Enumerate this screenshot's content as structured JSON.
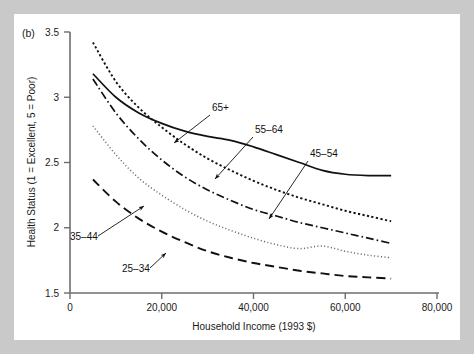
{
  "panel": {
    "label": "(b)"
  },
  "axes": {
    "x": {
      "title": "Household Income (1993 $)",
      "ticks": [
        "0",
        "20,000",
        "40,000",
        "60,000",
        "80,000"
      ],
      "tick_values": [
        0,
        20000,
        40000,
        60000,
        80000
      ],
      "range": [
        0,
        80000
      ]
    },
    "y": {
      "title": "Health Status (1 = Excellent, 5 = Poor)",
      "ticks": [
        "1.5",
        "2",
        "2.5",
        "3",
        "3.5"
      ],
      "tick_values": [
        1.5,
        2,
        2.5,
        3,
        3.5
      ],
      "range": [
        1.5,
        3.5
      ]
    }
  },
  "annotations": [
    {
      "id": "lbl-65plus",
      "text": "65+",
      "x": 198,
      "y": 97,
      "ax": 196,
      "ay": 101,
      "tx": 160,
      "ty": 129
    },
    {
      "id": "lbl-55-64",
      "text": "55–64",
      "x": 241,
      "y": 119,
      "ax": 239,
      "ay": 123,
      "tx": 201,
      "ty": 165
    },
    {
      "id": "lbl-45-54",
      "text": "45–54",
      "x": 296,
      "y": 143,
      "ax": 294,
      "ay": 147,
      "tx": 255,
      "ty": 205
    },
    {
      "id": "lbl-35-44",
      "text": "35–44",
      "x": 56,
      "y": 226,
      "ax": 84,
      "ay": 222,
      "tx": 130,
      "ty": 192
    },
    {
      "id": "lbl-25-34",
      "text": "25–34",
      "x": 108,
      "y": 258,
      "ax": 136,
      "ay": 254,
      "tx": 152,
      "ty": 239
    }
  ],
  "chart_data": {
    "type": "line",
    "title": "",
    "xlabel": "Household Income (1993 $)",
    "ylabel": "Health Status (1 = Excellent, 5 = Poor)",
    "xlim": [
      0,
      80000
    ],
    "ylim": [
      1.5,
      3.5
    ],
    "grid": false,
    "legend": "inline-annotations",
    "x": [
      5000,
      10000,
      15000,
      20000,
      25000,
      30000,
      35000,
      40000,
      45000,
      50000,
      55000,
      60000,
      65000,
      70000
    ],
    "series": [
      {
        "name": "65+",
        "style": "solid",
        "values": [
          3.18,
          3.0,
          2.88,
          2.8,
          2.74,
          2.7,
          2.67,
          2.62,
          2.56,
          2.5,
          2.44,
          2.41,
          2.4,
          2.4
        ]
      },
      {
        "name": "55–64",
        "style": "dotted-dense",
        "values": [
          3.42,
          3.12,
          2.92,
          2.77,
          2.64,
          2.53,
          2.44,
          2.36,
          2.29,
          2.23,
          2.18,
          2.13,
          2.09,
          2.05
        ]
      },
      {
        "name": "45–54",
        "style": "dash-dot",
        "values": [
          3.14,
          2.88,
          2.68,
          2.52,
          2.39,
          2.29,
          2.21,
          2.14,
          2.09,
          2.04,
          2.0,
          1.96,
          1.92,
          1.88
        ]
      },
      {
        "name": "35–44",
        "style": "dotted-fine",
        "values": [
          2.78,
          2.56,
          2.38,
          2.25,
          2.14,
          2.05,
          1.98,
          1.92,
          1.87,
          1.84,
          1.86,
          1.82,
          1.79,
          1.77
        ]
      },
      {
        "name": "25–34",
        "style": "dashed-long",
        "values": [
          2.37,
          2.2,
          2.07,
          1.97,
          1.89,
          1.82,
          1.77,
          1.73,
          1.7,
          1.67,
          1.65,
          1.63,
          1.62,
          1.61
        ]
      }
    ]
  }
}
